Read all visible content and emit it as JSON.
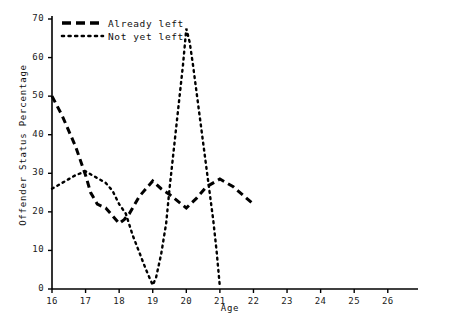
{
  "chart_data": {
    "type": "line",
    "title": "",
    "xlabel": "Age",
    "ylabel": "Offender Status Percentage",
    "xlim": [
      16,
      26.9
    ],
    "ylim": [
      0,
      70
    ],
    "xticks": [
      "16",
      "17",
      "18",
      "19",
      "20",
      "21",
      "22",
      "23",
      "24",
      "25",
      "26"
    ],
    "yticks": [
      "0",
      "10",
      "20",
      "30",
      "40",
      "50",
      "60",
      "70"
    ],
    "grid": false,
    "legend_position": "top-left-inside",
    "series": [
      {
        "name": "Already left",
        "style": "dashed",
        "color": "#000000",
        "points": [
          [
            16.0,
            50.0
          ],
          [
            16.3,
            45.0
          ],
          [
            16.7,
            37.0
          ],
          [
            17.0,
            29.5
          ],
          [
            17.15,
            25.0
          ],
          [
            17.35,
            22.0
          ],
          [
            17.6,
            21.0
          ],
          [
            18.0,
            17.0
          ],
          [
            18.15,
            18.0
          ],
          [
            18.3,
            19.5
          ],
          [
            18.6,
            24.0
          ],
          [
            19.0,
            28.0
          ],
          [
            19.25,
            26.0
          ],
          [
            19.5,
            24.5
          ],
          [
            20.0,
            21.0
          ],
          [
            20.3,
            23.5
          ],
          [
            20.6,
            26.5
          ],
          [
            21.0,
            28.5
          ],
          [
            21.4,
            26.5
          ],
          [
            22.0,
            22.0
          ]
        ]
      },
      {
        "name": "Not yet left",
        "style": "dotted",
        "color": "#000000",
        "points": [
          [
            16.0,
            26.0
          ],
          [
            16.3,
            27.5
          ],
          [
            16.7,
            29.5
          ],
          [
            17.0,
            30.5
          ],
          [
            17.3,
            29.0
          ],
          [
            17.6,
            27.5
          ],
          [
            17.8,
            25.5
          ],
          [
            18.0,
            22.0
          ],
          [
            18.2,
            19.5
          ],
          [
            18.4,
            14.0
          ],
          [
            18.6,
            9.5
          ],
          [
            18.8,
            5.0
          ],
          [
            19.0,
            1.0
          ],
          [
            19.1,
            3.0
          ],
          [
            19.25,
            9.0
          ],
          [
            19.4,
            17.0
          ],
          [
            19.5,
            26.0
          ],
          [
            19.6,
            34.0
          ],
          [
            19.75,
            46.0
          ],
          [
            19.9,
            58.0
          ],
          [
            20.0,
            67.5
          ],
          [
            20.1,
            64.0
          ],
          [
            20.2,
            58.0
          ],
          [
            20.35,
            48.0
          ],
          [
            20.5,
            38.0
          ],
          [
            20.65,
            28.0
          ],
          [
            20.8,
            18.0
          ],
          [
            20.9,
            10.0
          ],
          [
            21.0,
            0.5
          ]
        ]
      }
    ]
  },
  "legend": {
    "items": [
      {
        "label": "Already left",
        "style": "dashed"
      },
      {
        "label": "Not yet left",
        "style": "dotted"
      }
    ]
  }
}
